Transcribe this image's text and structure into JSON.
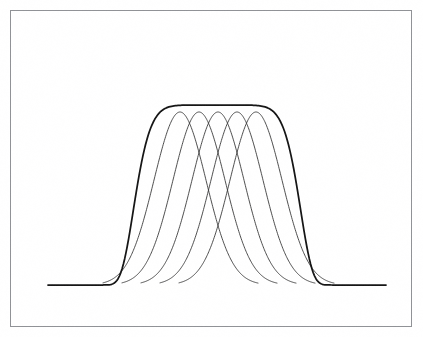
{
  "figure": {
    "title": "",
    "background_color": "#ffffff",
    "frame_color": "#8e9094",
    "envelope_color": "#111111",
    "channel_color": "#2b2b2b",
    "frame": {
      "x": 10,
      "y": 10,
      "width": 402,
      "height": 317
    }
  },
  "chart_data": {
    "type": "line",
    "title": "",
    "subtitle": "",
    "xlabel": "",
    "ylabel": "",
    "xlim": [
      0,
      423
    ],
    "ylim": [
      0,
      1.02
    ],
    "grid": false,
    "legend": null,
    "axes_visible": false,
    "tick_labels": {
      "x": [],
      "y": []
    },
    "annotations": [],
    "baseline_y_px": 285,
    "peak_y_px": 112,
    "envelope_top_y_px": 106,
    "series": [
      {
        "name": "channel-1",
        "kind": "gaussian",
        "center_px": 180,
        "sigma_px": 26,
        "peak_value": 1.0,
        "left_foot_px": 103,
        "right_foot_px": 258
      },
      {
        "name": "channel-2",
        "kind": "gaussian",
        "center_px": 199,
        "sigma_px": 26,
        "peak_value": 1.0,
        "left_foot_px": 122,
        "right_foot_px": 277
      },
      {
        "name": "channel-3",
        "kind": "gaussian",
        "center_px": 218,
        "sigma_px": 26,
        "peak_value": 1.0,
        "left_foot_px": 141,
        "right_foot_px": 296
      },
      {
        "name": "channel-4",
        "kind": "gaussian",
        "center_px": 237,
        "sigma_px": 26,
        "peak_value": 1.0,
        "left_foot_px": 160,
        "right_foot_px": 315
      },
      {
        "name": "channel-5",
        "kind": "gaussian",
        "center_px": 256,
        "sigma_px": 26,
        "peak_value": 1.0,
        "left_foot_px": 179,
        "right_foot_px": 334
      },
      {
        "name": "composite-envelope",
        "kind": "super-gaussian",
        "center_px": 217,
        "sigma_px": 78,
        "order": 8,
        "peak_value": 1.04,
        "left_foot_px": 48,
        "right_foot_px": 386,
        "emphasis": true
      }
    ]
  }
}
